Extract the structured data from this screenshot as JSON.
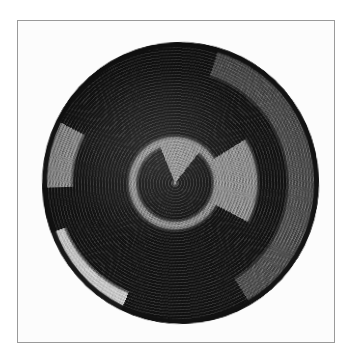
{
  "page": {
    "width": 355,
    "height": 363,
    "background_color": "#ffffff",
    "description": "Photograph of a circular coiled basket with a black-and-gray spiral design, shown inside a thin rectangular frame on a white page."
  },
  "frame": {
    "name": "photo-frame",
    "border_color": "#9a9a9a",
    "border_width_px": 1,
    "left": 17,
    "top": 20,
    "width": 318,
    "height": 323,
    "inner_background": "#fcfcfc"
  },
  "photo": {
    "subject": "coiled woven basket",
    "shape": "circular",
    "view": "top-down / plan view",
    "texture": "coiled weave, concentric stitched rows",
    "center_x_pct": 48,
    "center_y_pct": 50,
    "diameter_px": 277
  },
  "palette": {
    "black": "#131313",
    "dark_gray": "#4f4f4f",
    "mid_gray": "#8d8d8d",
    "light_gray": "#b4b4b4",
    "highlight": "#d8d8d8",
    "paper_white": "#fcfcfc",
    "frame_line": "#9a9a9a"
  },
  "design": {
    "motif": "double spiral / whirl",
    "turns": 2.5,
    "arms": [
      {
        "name": "black-outer-arm",
        "color": "#131313",
        "start_angle_deg": 300,
        "sweep_deg": 330,
        "inner_radius_pct": 40,
        "outer_radius_pct": 100
      },
      {
        "name": "black-mid-arm",
        "color": "#131313",
        "start_angle_deg": 120,
        "sweep_deg": 300,
        "inner_radius_pct": 22,
        "outer_radius_pct": 52
      },
      {
        "name": "black-core-arm",
        "color": "#131313",
        "start_angle_deg": 40,
        "sweep_deg": 300,
        "inner_radius_pct": 0,
        "outer_radius_pct": 20
      },
      {
        "name": "dark-gray-lower-arm",
        "color": "#4f4f4f",
        "start_angle_deg": 20,
        "sweep_deg": 130,
        "inner_radius_pct": 55,
        "outer_radius_pct": 85
      },
      {
        "name": "light-streak-upper-left",
        "color": "#d8d8d8",
        "start_angle_deg": 205,
        "sweep_deg": 45,
        "inner_radius_pct": 58,
        "outer_radius_pct": 88
      }
    ],
    "rim": {
      "name": "black-rim-band",
      "color": "#131313",
      "thickness_px": 5
    }
  },
  "basket_geometry": {
    "left": 24,
    "top": 21,
    "width": 277,
    "height": 282,
    "rotation_deg": -2
  }
}
